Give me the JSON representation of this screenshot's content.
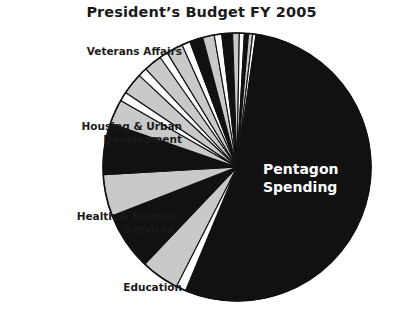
{
  "chart_title": "President’s Budget FY 2005",
  "labels": {
    "veterans": "Veterans Affairs",
    "housing": "Housing & Urban\nDevelopment",
    "health": "Health & Human\nServices",
    "education": "Education",
    "pentagon": "Pentagon\nSpending"
  },
  "colors": {
    "slice_dark": "#111111",
    "slice_gray": "#c9c9c9",
    "slice_white": "#ffffff",
    "outline": "#111111",
    "text_dark": "#1a1a1a",
    "text_light": "#ffffff",
    "background": "#ffffff"
  },
  "geometry": {
    "center_x": 237,
    "center_y": 167,
    "radius": 134,
    "start_angle_deg": -80
  },
  "chart_data": {
    "type": "pie",
    "title": "President’s Budget FY 2005",
    "xlabel": "",
    "ylabel": "",
    "legend_position": "callout-labels",
    "grid": false,
    "categories": [
      "Pentagon Spending",
      "Education",
      "Health & Human Services",
      "Housing & Urban Development",
      "Veterans Affairs"
    ],
    "slices": [
      {
        "label": "Pentagon Spending",
        "value": 53.5,
        "color": "#111111",
        "labeled": true,
        "label_position": "inside"
      },
      {
        "label": "",
        "value": 1.2,
        "color": "#ffffff",
        "labeled": false,
        "label_position": "none"
      },
      {
        "label": "Education",
        "value": 4.6,
        "color": "#c9c9c9",
        "labeled": true,
        "label_position": "outside-left"
      },
      {
        "label": "",
        "value": 7.0,
        "color": "#111111",
        "labeled": false,
        "label_position": "none"
      },
      {
        "label": "Health & Human Services",
        "value": 5.0,
        "color": "#c9c9c9",
        "labeled": true,
        "label_position": "outside-left"
      },
      {
        "label": "",
        "value": 6.2,
        "color": "#111111",
        "labeled": false,
        "label_position": "none"
      },
      {
        "label": "Housing & Urban Development",
        "value": 3.0,
        "color": "#c9c9c9",
        "labeled": true,
        "label_position": "outside-left"
      },
      {
        "label": "",
        "value": 1.1,
        "color": "#ffffff",
        "labeled": false,
        "label_position": "none"
      },
      {
        "label": "",
        "value": 2.6,
        "color": "#c9c9c9",
        "labeled": false,
        "label_position": "none"
      },
      {
        "label": "",
        "value": 1.1,
        "color": "#ffffff",
        "labeled": false,
        "label_position": "none"
      },
      {
        "label": "",
        "value": 2.2,
        "color": "#c9c9c9",
        "labeled": false,
        "label_position": "none"
      },
      {
        "label": "",
        "value": 1.0,
        "color": "#ffffff",
        "labeled": false,
        "label_position": "none"
      },
      {
        "label": "Veterans Affairs",
        "value": 2.0,
        "color": "#c9c9c9",
        "labeled": true,
        "label_position": "outside-left"
      },
      {
        "label": "",
        "value": 1.0,
        "color": "#ffffff",
        "labeled": false,
        "label_position": "none"
      },
      {
        "label": "",
        "value": 1.6,
        "color": "#111111",
        "labeled": false,
        "label_position": "none"
      },
      {
        "label": "",
        "value": 1.4,
        "color": "#c9c9c9",
        "labeled": false,
        "label_position": "none"
      },
      {
        "label": "",
        "value": 0.9,
        "color": "#ffffff",
        "labeled": false,
        "label_position": "none"
      },
      {
        "label": "",
        "value": 1.3,
        "color": "#111111",
        "labeled": false,
        "label_position": "none"
      },
      {
        "label": "",
        "value": 0.8,
        "color": "#c9c9c9",
        "labeled": false,
        "label_position": "none"
      },
      {
        "label": "",
        "value": 0.6,
        "color": "#ffffff",
        "labeled": false,
        "label_position": "none"
      },
      {
        "label": "",
        "value": 0.5,
        "color": "#111111",
        "labeled": false,
        "label_position": "none"
      },
      {
        "label": "",
        "value": 0.5,
        "color": "#c9c9c9",
        "labeled": false,
        "label_position": "none"
      },
      {
        "label": "",
        "value": 0.4,
        "color": "#ffffff",
        "labeled": false,
        "label_position": "none"
      },
      {
        "label": "",
        "value": 0.5,
        "color": "#111111",
        "labeled": false,
        "label_position": "none"
      }
    ]
  }
}
